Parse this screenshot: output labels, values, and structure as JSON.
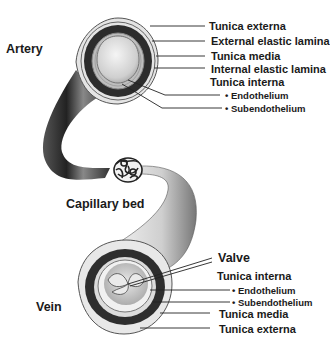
{
  "diagram": {
    "colors": {
      "background": "#ffffff",
      "text": "#1a1a1a",
      "vessel_dark": "#2b2b2b",
      "vessel_light": "#d9d9d9",
      "media_band": "#303030",
      "externa_fill": "#e6e6e6",
      "leader_line": "#222222"
    },
    "main_labels": {
      "artery": "Artery",
      "capillary_bed": "Capillary bed",
      "vein": "Vein"
    },
    "artery_labels": [
      {
        "text": "Tunica externa",
        "bullet": false
      },
      {
        "text": "External elastic lamina",
        "bullet": false
      },
      {
        "text": "Tunica media",
        "bullet": false
      },
      {
        "text": "Internal elastic lamina",
        "bullet": false
      },
      {
        "text": "Tunica interna",
        "bullet": false
      },
      {
        "text": "Endothelium",
        "bullet": true
      },
      {
        "text": "Subendothelium",
        "bullet": true
      }
    ],
    "vein_labels": [
      {
        "text": "Valve",
        "bullet": false
      },
      {
        "text": "Tunica interna",
        "bullet": false
      },
      {
        "text": "Endothelium",
        "bullet": true
      },
      {
        "text": "Subendothelium",
        "bullet": true
      },
      {
        "text": "Tunica media",
        "bullet": false
      },
      {
        "text": "Tunica externa",
        "bullet": false
      }
    ]
  }
}
